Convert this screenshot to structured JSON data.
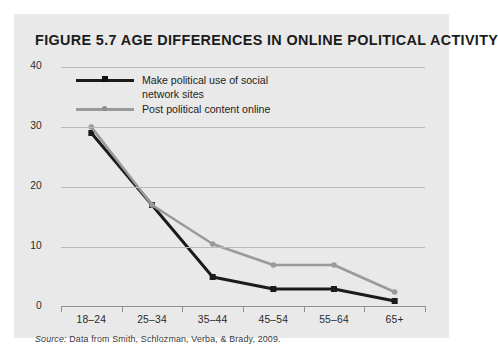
{
  "figure": {
    "title": "FIGURE 5.7 AGE DIFFERENCES IN ONLINE POLITICAL ACTIVITY",
    "title_parts": {
      "figure_word": "Figure",
      "number": "5.7",
      "heading": "Age Differences in Online Political Activity"
    },
    "source_label": "Source:",
    "source_text": " Data from Smith, Schlozman, Verba, & Brady, 2009.",
    "panel_color": "#e9e9e9",
    "page_color": "#ffffff"
  },
  "chart_data": {
    "type": "line",
    "title": "Age Differences in Online Political Activity",
    "xlabel": "",
    "ylabel": "",
    "categories": [
      "18–24",
      "25–34",
      "35–44",
      "45–54",
      "55–64",
      "65+"
    ],
    "series": [
      {
        "name": "Make political use of social network sites",
        "values": [
          29,
          17,
          5,
          3,
          3,
          1
        ],
        "color": "#1b1b1b",
        "marker": "square"
      },
      {
        "name": "Post political content online",
        "values": [
          30,
          17,
          10.5,
          7,
          7,
          2.5
        ],
        "color": "#9a9a9a",
        "marker": "circle"
      }
    ],
    "ylim": [
      0,
      40
    ],
    "yticks": [
      0,
      10,
      20,
      30,
      40
    ],
    "ytick_labels": [
      "0",
      "10",
      "20",
      "30",
      "40"
    ],
    "grid": true,
    "grid_color": "#b9b9b9",
    "legend_position": "top-left"
  },
  "legend": {
    "items": [
      {
        "label_line1": "Make political use of social",
        "label_line2": "network sites"
      },
      {
        "label_line1": "Post political content online",
        "label_line2": ""
      }
    ]
  }
}
